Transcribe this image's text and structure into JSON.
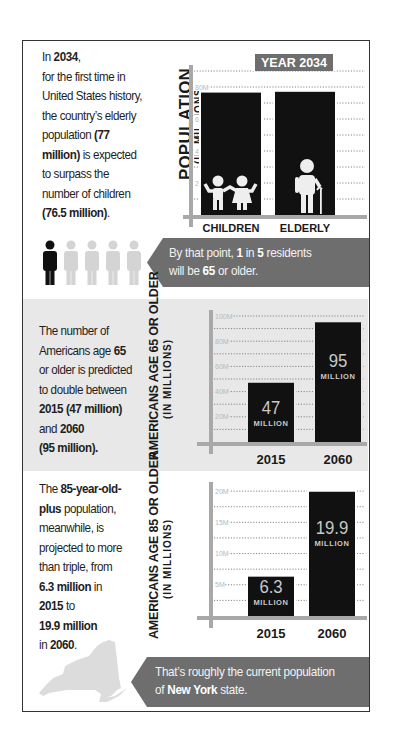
{
  "section1": {
    "text_parts": [
      {
        "t": "In ",
        "b": false
      },
      {
        "t": "2034",
        "b": true
      },
      {
        "t": ",\nfor the first time in\nUnited States history,\nthe country’s elderly\npopulation ",
        "b": false
      },
      {
        "t": "(77\nmillion)",
        "b": true
      },
      {
        "t": " is expected\nto surpass the\nnumber of children\n",
        "b": false
      },
      {
        "t": "(76.5 million)",
        "b": true
      },
      {
        "t": ".",
        "b": false
      }
    ],
    "ylabel_main": "POPULATION",
    "ylabel_sub": "(IN MILLIONS)",
    "year_badge": "YEAR 2034",
    "icons": [
      "children-icon",
      "elderly-icon"
    ]
  },
  "banner1": {
    "parts": [
      {
        "t": "By that point, ",
        "b": false
      },
      {
        "t": "1",
        "b": true
      },
      {
        "t": " in ",
        "b": false
      },
      {
        "t": "5",
        "b": true
      },
      {
        "t": " residents\nwill be ",
        "b": false
      },
      {
        "t": "65",
        "b": true
      },
      {
        "t": " or older.",
        "b": false
      }
    ],
    "people_total": 5,
    "people_highlighted": 1
  },
  "section2": {
    "text_parts": [
      {
        "t": "The number of\nAmericans age ",
        "b": false
      },
      {
        "t": "65",
        "b": true
      },
      {
        "t": "\nor older is predicted\nto double between\n",
        "b": false
      },
      {
        "t": "2015 (47 million)",
        "b": true
      },
      {
        "t": "\nand ",
        "b": false
      },
      {
        "t": "2060",
        "b": true
      },
      {
        "t": "\n",
        "b": false
      },
      {
        "t": "(95 million).",
        "b": true
      }
    ],
    "ylabel_main": "AMERICANS AGE 65 OR OLDER",
    "ylabel_sub": "(IN MILLIONS)"
  },
  "section3": {
    "text_parts": [
      {
        "t": "The ",
        "b": false
      },
      {
        "t": "85-year-old-\nplus",
        "b": true
      },
      {
        "t": " population,\nmeanwhile, is\nprojected to more\nthan triple, from\n",
        "b": false
      },
      {
        "t": "6.3 million",
        "b": true
      },
      {
        "t": " in\n",
        "b": false
      },
      {
        "t": "2015",
        "b": true
      },
      {
        "t": " to\n",
        "b": false
      },
      {
        "t": "19.9 million",
        "b": true
      },
      {
        "t": "\nin ",
        "b": false
      },
      {
        "t": "2060",
        "b": true
      },
      {
        "t": ".",
        "b": false
      }
    ],
    "ylabel_main": "AMERICANS AGE 85 OR OLDER",
    "ylabel_sub": "(IN MILLIONS)"
  },
  "banner2": {
    "parts": [
      {
        "t": "That’s roughly the current population\nof ",
        "b": false
      },
      {
        "t": "New York",
        "b": true
      },
      {
        "t": " state.",
        "b": false
      }
    ],
    "icon": "new-york-state-map-icon"
  },
  "colors": {
    "bar": "#111111",
    "axis": "#a8a8a8",
    "banner": "#6e6e6e",
    "badge": "#6e6e6e",
    "section_bg": "#e8e8e8",
    "person_active": "#111111",
    "person_inactive": "#d4d4d4"
  },
  "chart_data": [
    {
      "type": "bar",
      "title": "YEAR 2034",
      "categories": [
        "CHILDREN",
        "ELDERLY"
      ],
      "values": [
        76.5,
        77
      ],
      "unit": "M",
      "xlabel": "",
      "ylabel": "POPULATION (IN MILLIONS)",
      "ylim": [
        0,
        90
      ],
      "yticks": [
        20,
        40,
        60,
        80
      ],
      "ytick_labels": [
        "20M",
        "40M",
        "60M",
        "80M"
      ],
      "grid": true,
      "data_labels": []
    },
    {
      "type": "bar",
      "title": "",
      "categories": [
        "2015",
        "2060"
      ],
      "values": [
        47,
        95
      ],
      "unit": "M",
      "xlabel": "",
      "ylabel": "AMERICANS AGE 65 OR OLDER (IN MILLIONS)",
      "ylim": [
        0,
        100
      ],
      "yticks": [
        20,
        40,
        60,
        80,
        100
      ],
      "ytick_labels": [
        "20M",
        "40M",
        "60M",
        "80M",
        "100M"
      ],
      "grid": true,
      "data_labels": [
        {
          "value": "47",
          "unit": "MILLION"
        },
        {
          "value": "95",
          "unit": "MILLION"
        }
      ]
    },
    {
      "type": "bar",
      "title": "",
      "categories": [
        "2015",
        "2060"
      ],
      "values": [
        6.3,
        19.9
      ],
      "unit": "M",
      "xlabel": "",
      "ylabel": "AMERICANS AGE 85 OR OLDER (IN MILLIONS)",
      "ylim": [
        0,
        20.5
      ],
      "yticks": [
        5,
        10,
        15,
        20
      ],
      "ytick_labels": [
        "5M",
        "10M",
        "15M",
        "20M"
      ],
      "grid": true,
      "data_labels": [
        {
          "value": "6.3",
          "unit": "MILLION"
        },
        {
          "value": "19.9",
          "unit": "MILLION"
        }
      ]
    }
  ]
}
